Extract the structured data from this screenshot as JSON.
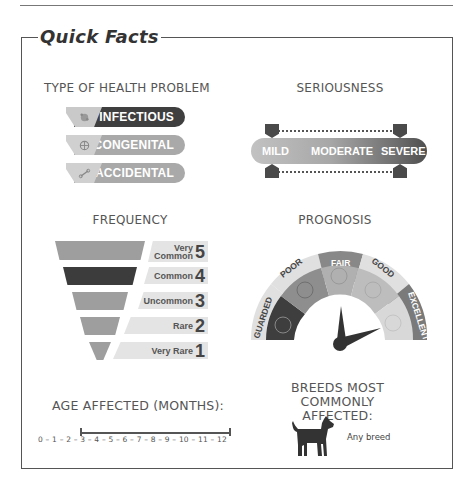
{
  "title": "Quick Facts",
  "health_problem": {
    "label": "TYPE OF HEALTH PROBLEM",
    "items": [
      {
        "label": "INFECTIOUS",
        "icon": "germ-icon",
        "selected": true,
        "color": "#3f3f3f"
      },
      {
        "label": "CONGENITAL",
        "icon": "dna-icon",
        "selected": false,
        "color": "#a9a9a9"
      },
      {
        "label": "ACCIDENTAL",
        "icon": "bone-icon",
        "selected": false,
        "color": "#a9a9a9"
      }
    ]
  },
  "seriousness": {
    "label": "SERIOUSNESS",
    "levels": [
      "MILD",
      "MODERATE",
      "SEVERE"
    ],
    "range": [
      "MILD",
      "SEVERE"
    ]
  },
  "frequency": {
    "label": "FREQUENCY",
    "levels": [
      {
        "label_line1": "Very",
        "label_line2": "Common",
        "number": "5",
        "selected": false
      },
      {
        "label_line1": "",
        "label_line2": "Common",
        "number": "4",
        "selected": true
      },
      {
        "label_line1": "",
        "label_line2": "Uncommon",
        "number": "3",
        "selected": false
      },
      {
        "label_line1": "",
        "label_line2": "Rare",
        "number": "2",
        "selected": false
      },
      {
        "label_line1": "",
        "label_line2": "Very Rare",
        "number": "1",
        "selected": false
      }
    ]
  },
  "prognosis": {
    "label": "PROGNOSIS",
    "levels": [
      "GUARDED",
      "POOR",
      "FAIR",
      "GOOD",
      "EXCELLENT"
    ],
    "needle_range": [
      "FAIR",
      "EXCELLENT"
    ]
  },
  "age": {
    "label": "AGE AFFECTED (MONTHS):",
    "scale": "0 – 1 – 2 – 3 – 4 – 5 – 6 – 7 – 8 – 9 – 10 – 11 – 12",
    "range_start": 3,
    "range_end": 12
  },
  "breeds": {
    "label_line1": "BREEDS MOST",
    "label_line2": "COMMONLY AFFECTED:",
    "value": "Any breed"
  }
}
